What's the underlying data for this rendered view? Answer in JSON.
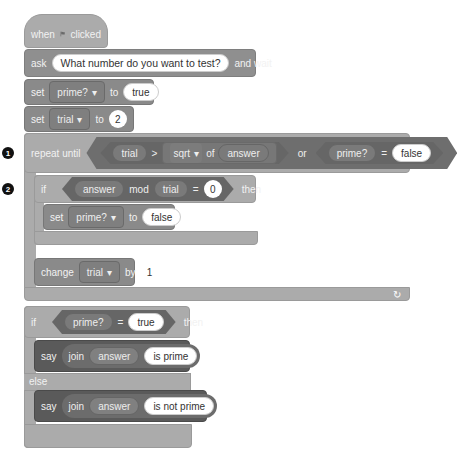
{
  "script": {
    "hat": {
      "when": "when",
      "icon": "green-flag-icon",
      "clicked": "clicked"
    },
    "ask": {
      "label": "ask",
      "question": "What number do you want to test?",
      "suffix": "and wait"
    },
    "set_prime": {
      "label": "set",
      "variable": "prime?",
      "to": "to",
      "value": "true"
    },
    "set_trial": {
      "label": "set",
      "variable": "trial",
      "to": "to",
      "value": "2"
    },
    "repeat_until": {
      "marker": "1",
      "label": "repeat until",
      "cond_left": {
        "a": "trial",
        "op": ">",
        "func": "sqrt",
        "of": "of",
        "arg": "answer"
      },
      "or": "or",
      "cond_right": {
        "a": "prime?",
        "op": "=",
        "b": "false"
      },
      "loop_icon": "↻"
    },
    "if_mod": {
      "marker": "2",
      "label": "if",
      "a": "answer",
      "mod": "mod",
      "b": "trial",
      "op": "=",
      "c": "0",
      "then": "then",
      "body_set": {
        "label": "set",
        "variable": "prime?",
        "to": "to",
        "value": "false"
      }
    },
    "change": {
      "label": "change",
      "variable": "trial",
      "by": "by",
      "value": "1"
    },
    "if_else": {
      "label": "if",
      "a": "prime?",
      "op": "=",
      "b": "true",
      "then": "then",
      "say1": {
        "label": "say",
        "join": "join",
        "arg": "answer",
        "text": "is prime"
      },
      "else": "else",
      "say2": {
        "label": "say",
        "join": "join",
        "arg": "answer",
        "text": "is not prime"
      }
    },
    "dropdown_arrow": "▾"
  }
}
